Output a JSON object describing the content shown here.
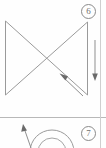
{
  "page": {
    "width": 106,
    "height": 148,
    "background_color": "#fefefe",
    "line_color": "#9a9a9a",
    "rule_color": "#b8b8b8",
    "label_color": "#6f6f6f"
  },
  "panels": [
    {
      "id": "panel-6",
      "badge_label": "6",
      "badge_name": "figure-number-6",
      "figure_type": "bowtie-hourglass-outline",
      "annotations": [
        {
          "name": "vertical-down-arrow",
          "direction": "down",
          "label": ""
        },
        {
          "name": "diagonal-up-left-arrow",
          "direction": "up-left",
          "label": ""
        }
      ],
      "geometry": {
        "top_left": [
          5,
          21
        ],
        "top_right": [
          88,
          22
        ],
        "bottom_left": [
          5,
          95
        ],
        "bottom_right": [
          88,
          95
        ],
        "crossing_point": [
          46,
          58
        ]
      }
    },
    {
      "id": "panel-7",
      "badge_label": "7",
      "badge_name": "figure-number-7",
      "figure_type": "concentric-arcs-outline",
      "annotations": [
        {
          "name": "diagonal-up-left-arrow",
          "direction": "up-left",
          "label": ""
        }
      ],
      "geometry": {
        "arc_center": [
          52,
          152
        ],
        "arc_radii": [
          14,
          22
        ]
      }
    }
  ],
  "icons": {
    "arrow_down": "arrow-down-icon",
    "arrow_up_left": "arrow-up-left-icon"
  }
}
